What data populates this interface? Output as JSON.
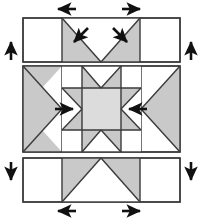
{
  "diagram": {
    "canvas": {
      "width": 202,
      "height": 219
    },
    "colors": {
      "background": "#ffffff",
      "patch_light": "#ffffff",
      "patch_shaded": "#c9c9c9",
      "patch_center": "#dcdcdc",
      "outline": "#3a3a3a",
      "arrow": "#111111"
    },
    "rows": [
      {
        "name": "top-row",
        "label": "Top row",
        "x": 23,
        "y": 18,
        "width": 157,
        "height": 44,
        "units": [
          {
            "name": "plain-square-left",
            "fill": "patch_light"
          },
          {
            "name": "flying-geese-left",
            "fill": "patch_shaded"
          },
          {
            "name": "flying-geese-right",
            "fill": "patch_shaded"
          },
          {
            "name": "plain-square-right",
            "fill": "patch_light"
          }
        ]
      },
      {
        "name": "middle-row",
        "label": "Middle row",
        "x": 23,
        "y": 66,
        "width": 157,
        "height": 86,
        "units": [
          {
            "name": "side-triangle-left",
            "fill": "patch_shaded"
          },
          {
            "name": "sawtooth-star-center",
            "fill": "patch_center"
          },
          {
            "name": "side-triangle-right",
            "fill": "patch_shaded"
          }
        ]
      },
      {
        "name": "bottom-row",
        "label": "Bottom row",
        "x": 23,
        "y": 158,
        "width": 157,
        "height": 44,
        "units": [
          {
            "name": "plain-square-left",
            "fill": "patch_light"
          },
          {
            "name": "flying-geese-center",
            "fill": "patch_shaded"
          },
          {
            "name": "plain-square-right",
            "fill": "patch_light"
          }
        ]
      }
    ],
    "arrows": [
      {
        "name": "arrow-top-left",
        "direction": "left",
        "glyph": "←",
        "x": 63,
        "y": 9,
        "length": 22,
        "position": "above-top-row"
      },
      {
        "name": "arrow-top-right",
        "direction": "right",
        "glyph": "→",
        "x": 128,
        "y": 9,
        "length": 22,
        "position": "above-top-row"
      },
      {
        "name": "arrow-left-top-row",
        "direction": "up",
        "glyph": "↑",
        "x": 11,
        "y": 50,
        "length": 22,
        "position": "left-of-top-row"
      },
      {
        "name": "arrow-right-top-row",
        "direction": "up",
        "glyph": "↑",
        "x": 191,
        "y": 50,
        "length": 22,
        "position": "right-of-top-row"
      },
      {
        "name": "arrow-inner-top-left",
        "direction": "down-left",
        "glyph": "↙",
        "x": 78,
        "y": 35,
        "length": 18,
        "position": "inside-top-row"
      },
      {
        "name": "arrow-inner-top-right",
        "direction": "down-right",
        "glyph": "↘",
        "x": 119,
        "y": 35,
        "length": 18,
        "position": "inside-top-row"
      },
      {
        "name": "arrow-inner-center-left",
        "direction": "right",
        "glyph": "→",
        "x": 66,
        "y": 108,
        "length": 18,
        "position": "inside-middle-row"
      },
      {
        "name": "arrow-inner-center-right",
        "direction": "left",
        "glyph": "←",
        "x": 136,
        "y": 108,
        "length": 18,
        "position": "inside-middle-row"
      },
      {
        "name": "arrow-left-bottom-row",
        "direction": "down",
        "glyph": "↓",
        "x": 11,
        "y": 170,
        "length": 22,
        "position": "left-of-bottom-row"
      },
      {
        "name": "arrow-right-bottom-row",
        "direction": "down",
        "glyph": "↓",
        "x": 191,
        "y": 170,
        "length": 22,
        "position": "right-of-bottom-row"
      },
      {
        "name": "arrow-bottom-left",
        "direction": "left",
        "glyph": "←",
        "x": 63,
        "y": 210,
        "length": 22,
        "position": "below-bottom-row"
      },
      {
        "name": "arrow-bottom-right",
        "direction": "right",
        "glyph": "→",
        "x": 128,
        "y": 210,
        "length": 22,
        "position": "below-bottom-row"
      }
    ]
  }
}
